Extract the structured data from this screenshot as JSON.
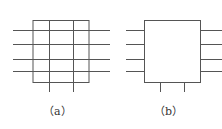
{
  "diagram": {
    "panels": [
      {
        "id": "a",
        "label": "（a）",
        "type": "grid-box-with-through-lines"
      },
      {
        "id": "b",
        "label": "（b）",
        "type": "box-with-stub-lines"
      }
    ],
    "stroke_color": "#555555",
    "background": "#ffffff"
  }
}
